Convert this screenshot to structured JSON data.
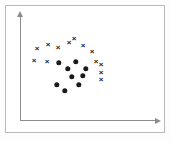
{
  "figure": {
    "title": "",
    "background_color": "#ffffff",
    "frame_color": "#b9b9b9",
    "axis_color": "#8d8d8d",
    "marker_color": "#1a1a1a"
  },
  "chart_data": {
    "type": "scatter",
    "title": "",
    "xlabel": "",
    "ylabel": "",
    "grid": false,
    "legend": "none",
    "xlim": [
      0,
      100
    ],
    "ylim": [
      0,
      100
    ],
    "axis_style": "two-arrowed-axes-origin-lower-left",
    "series": [
      {
        "name": "cross",
        "marker": "x",
        "color": "#1a1a1a",
        "count": 13,
        "points": [
          {
            "x": 27,
            "y": 72
          },
          {
            "x": 35,
            "y": 76
          },
          {
            "x": 44,
            "y": 73
          },
          {
            "x": 53,
            "y": 79
          },
          {
            "x": 65,
            "y": 76
          },
          {
            "x": 74,
            "y": 69
          },
          {
            "x": 23,
            "y": 62
          },
          {
            "x": 33,
            "y": 61
          },
          {
            "x": 83,
            "y": 57
          },
          {
            "x": 83,
            "y": 50
          },
          {
            "x": 83,
            "y": 43
          },
          {
            "x": 78,
            "y": 62
          },
          {
            "x": 59,
            "y": 83
          }
        ]
      },
      {
        "name": "dot",
        "marker": "o",
        "color": "#1a1a1a",
        "count": 9,
        "points": [
          {
            "x": 44,
            "y": 60
          },
          {
            "x": 58,
            "y": 61
          },
          {
            "x": 51,
            "y": 55
          },
          {
            "x": 68,
            "y": 55
          },
          {
            "x": 42,
            "y": 42
          },
          {
            "x": 48,
            "y": 37
          },
          {
            "x": 60,
            "y": 42
          },
          {
            "x": 64,
            "y": 50
          },
          {
            "x": 55,
            "y": 48
          }
        ]
      }
    ]
  },
  "markers": {
    "crosses": [
      {
        "name": "cross-1",
        "left": 31,
        "top": 43,
        "glyph": "×"
      },
      {
        "name": "cross-2",
        "left": 42,
        "top": 39,
        "glyph": "×"
      },
      {
        "name": "cross-3",
        "left": 52,
        "top": 42,
        "glyph": "×"
      },
      {
        "name": "cross-4",
        "left": 63,
        "top": 37,
        "glyph": "×"
      },
      {
        "name": "cross-5",
        "left": 77,
        "top": 40,
        "glyph": "×"
      },
      {
        "name": "cross-6",
        "left": 86,
        "top": 46,
        "glyph": "×"
      },
      {
        "name": "cross-7",
        "left": 28,
        "top": 55,
        "glyph": "×"
      },
      {
        "name": "cross-8",
        "left": 41,
        "top": 56,
        "glyph": "×"
      },
      {
        "name": "cross-9",
        "left": 95,
        "top": 59,
        "glyph": "×"
      },
      {
        "name": "cross-10",
        "left": 95,
        "top": 67,
        "glyph": "×"
      },
      {
        "name": "cross-11",
        "left": 95,
        "top": 74,
        "glyph": "×"
      },
      {
        "name": "cross-12",
        "left": 90,
        "top": 56,
        "glyph": "×"
      },
      {
        "name": "cross-13",
        "left": 68,
        "top": 33,
        "glyph": "×"
      }
    ],
    "dots": [
      {
        "name": "dot-1",
        "left": 53,
        "top": 57
      },
      {
        "name": "dot-2",
        "left": 70,
        "top": 56
      },
      {
        "name": "dot-3",
        "left": 62,
        "top": 63
      },
      {
        "name": "dot-4",
        "left": 80,
        "top": 63
      },
      {
        "name": "dot-5",
        "left": 51,
        "top": 79
      },
      {
        "name": "dot-6",
        "left": 59,
        "top": 85
      },
      {
        "name": "dot-7",
        "left": 73,
        "top": 79
      },
      {
        "name": "dot-8",
        "left": 77,
        "top": 70
      },
      {
        "name": "dot-9",
        "left": 66,
        "top": 71
      }
    ]
  }
}
